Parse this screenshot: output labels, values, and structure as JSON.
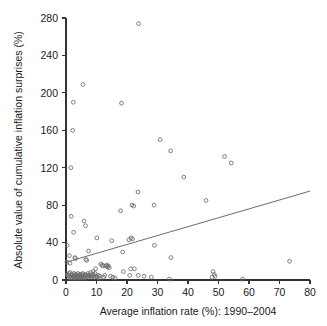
{
  "chart_data": {
    "type": "scatter",
    "title": "",
    "xlabel": "Average inflation rate (%): 1990–2004",
    "ylabel": "Absolute value of cumulative inflation surprises (%)",
    "xlim": [
      0,
      80
    ],
    "ylim": [
      0,
      280
    ],
    "xticks": [
      0,
      10,
      20,
      30,
      40,
      50,
      60,
      70,
      80
    ],
    "yticks": [
      0,
      40,
      80,
      120,
      160,
      200,
      240,
      280
    ],
    "xticklabels": [
      "0",
      "10",
      "20",
      "30",
      "40",
      "50",
      "60",
      "70",
      "80"
    ],
    "yticklabels": [
      "0",
      "40",
      "80",
      "120",
      "160",
      "200",
      "240",
      "280"
    ],
    "grid": false,
    "legend": null,
    "marker": "open-circle",
    "marker_color": "#6b6b6b",
    "series": [
      {
        "name": "Countries",
        "points": [
          [
            23.8,
            274
          ],
          [
            5.6,
            209
          ],
          [
            2.4,
            190
          ],
          [
            18.2,
            189
          ],
          [
            2.2,
            160
          ],
          [
            30.9,
            150
          ],
          [
            34.3,
            138
          ],
          [
            52.0,
            132
          ],
          [
            54.2,
            125
          ],
          [
            1.6,
            120
          ],
          [
            38.6,
            110
          ],
          [
            23.6,
            94
          ],
          [
            45.9,
            85
          ],
          [
            28.9,
            80
          ],
          [
            21.6,
            80
          ],
          [
            22.2,
            79
          ],
          [
            17.9,
            74
          ],
          [
            1.7,
            68
          ],
          [
            5.9,
            63
          ],
          [
            6.4,
            58
          ],
          [
            2.5,
            51
          ],
          [
            10.1,
            45
          ],
          [
            15.0,
            42
          ],
          [
            20.6,
            43
          ],
          [
            21.3,
            45
          ],
          [
            21.8,
            44
          ],
          [
            29.0,
            37
          ],
          [
            0.4,
            37
          ],
          [
            18.6,
            30
          ],
          [
            34.4,
            24
          ],
          [
            7.4,
            31
          ],
          [
            1.1,
            26
          ],
          [
            2.9,
            24
          ],
          [
            3.1,
            23
          ],
          [
            6.5,
            22
          ],
          [
            6.8,
            21
          ],
          [
            0.3,
            19
          ],
          [
            1.3,
            18
          ],
          [
            73.3,
            20
          ],
          [
            11.4,
            17
          ],
          [
            11.9,
            16
          ],
          [
            12.1,
            15
          ],
          [
            13.0,
            15
          ],
          [
            13.4,
            16
          ],
          [
            13.6,
            14
          ],
          [
            13.9,
            15
          ],
          [
            14.2,
            13
          ],
          [
            9.7,
            12
          ],
          [
            18.8,
            9
          ],
          [
            21.2,
            12
          ],
          [
            22.4,
            12
          ],
          [
            20.9,
            5
          ],
          [
            23.7,
            5
          ],
          [
            25.6,
            4
          ],
          [
            28.0,
            3
          ],
          [
            33.9,
            1
          ],
          [
            48.2,
            9
          ],
          [
            48.6,
            6
          ],
          [
            48.9,
            4
          ],
          [
            47.9,
            3
          ],
          [
            57.9,
            1
          ],
          [
            0.5,
            6
          ],
          [
            0.7,
            5
          ],
          [
            0.9,
            4
          ],
          [
            1.0,
            7
          ],
          [
            1.2,
            3
          ],
          [
            1.4,
            8
          ],
          [
            1.5,
            2
          ],
          [
            1.8,
            5
          ],
          [
            1.9,
            3
          ],
          [
            2.0,
            6
          ],
          [
            2.1,
            2
          ],
          [
            2.3,
            4
          ],
          [
            2.6,
            7
          ],
          [
            2.7,
            3
          ],
          [
            2.8,
            5
          ],
          [
            3.0,
            2
          ],
          [
            3.2,
            6
          ],
          [
            3.4,
            4
          ],
          [
            3.5,
            3
          ],
          [
            3.6,
            5
          ],
          [
            3.8,
            2
          ],
          [
            3.9,
            7
          ],
          [
            4.0,
            4
          ],
          [
            4.2,
            3
          ],
          [
            4.4,
            6
          ],
          [
            4.5,
            2
          ],
          [
            4.7,
            5
          ],
          [
            4.9,
            3
          ],
          [
            5.0,
            4
          ],
          [
            5.2,
            6
          ],
          [
            5.4,
            2
          ],
          [
            5.5,
            7
          ],
          [
            5.7,
            3
          ],
          [
            5.8,
            5
          ],
          [
            6.0,
            4
          ],
          [
            6.1,
            2
          ],
          [
            6.3,
            6
          ],
          [
            6.6,
            3
          ],
          [
            6.9,
            5
          ],
          [
            7.0,
            4
          ],
          [
            7.2,
            7
          ],
          [
            7.5,
            3
          ],
          [
            7.7,
            5
          ],
          [
            7.9,
            4
          ],
          [
            8.1,
            8
          ],
          [
            8.3,
            3
          ],
          [
            8.5,
            6
          ],
          [
            8.7,
            4
          ],
          [
            8.9,
            9
          ],
          [
            9.1,
            5
          ],
          [
            9.3,
            3
          ],
          [
            9.5,
            7
          ],
          [
            9.9,
            4
          ],
          [
            10.3,
            3
          ],
          [
            10.6,
            5
          ],
          [
            10.9,
            2
          ],
          [
            11.1,
            4
          ],
          [
            12.4,
            3
          ],
          [
            12.7,
            5
          ],
          [
            14.6,
            4
          ],
          [
            15.4,
            3
          ],
          [
            16.1,
            2
          ]
        ]
      }
    ],
    "trendline": {
      "type": "linear-fit",
      "x_start": 0,
      "y_start": 19,
      "x_end": 80,
      "y_end": 95
    }
  }
}
